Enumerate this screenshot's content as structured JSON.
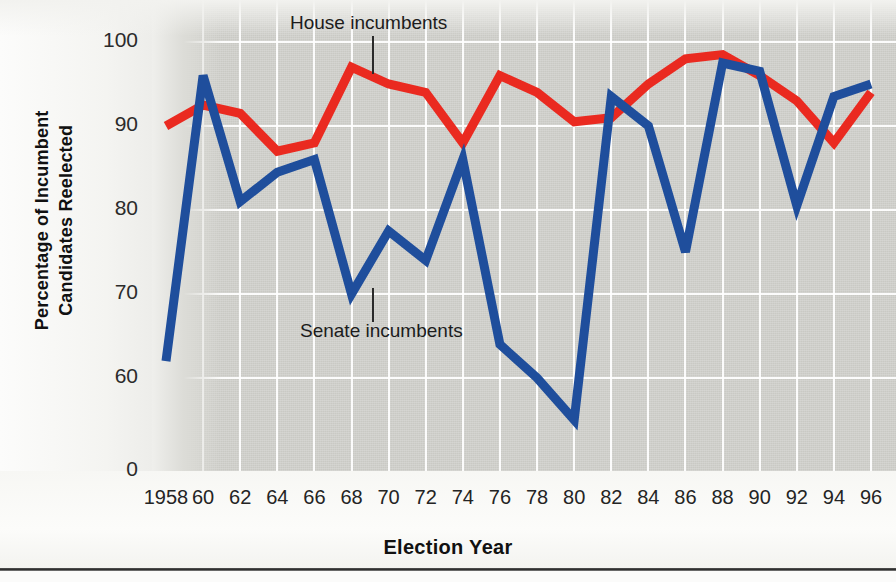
{
  "chart_data": {
    "type": "line",
    "title": "",
    "xlabel": "Election Year",
    "ylabel": "Percentage of Incumbent Candidates Reelected",
    "ylabel_line1": "Percentage of Incumbent",
    "ylabel_line2": "Candidates Reelected",
    "categories": [
      "1958",
      "60",
      "62",
      "64",
      "66",
      "68",
      "70",
      "72",
      "74",
      "76",
      "78",
      "80",
      "82",
      "84",
      "86",
      "88",
      "90",
      "92",
      "94",
      "96"
    ],
    "x": [
      1958,
      1960,
      1962,
      1964,
      1966,
      1968,
      1970,
      1972,
      1974,
      1976,
      1978,
      1980,
      1982,
      1984,
      1986,
      1988,
      1990,
      1992,
      1994,
      1996
    ],
    "yticks": [
      100,
      90,
      80,
      70,
      60,
      0
    ],
    "ytick_labels": [
      "100",
      "90",
      "80",
      "70",
      "60",
      "0"
    ],
    "ylim": [
      52,
      102
    ],
    "axis_break": true,
    "grid": true,
    "legend_position": "inline-annotations",
    "series": [
      {
        "name": "House incumbents",
        "color": "#ea2a20",
        "values": [
          90,
          92.5,
          91.5,
          87,
          88,
          97,
          95,
          94,
          88,
          96,
          94,
          90.5,
          91,
          95,
          98,
          98.5,
          96,
          93,
          88,
          94
        ]
      },
      {
        "name": "Senate incumbents",
        "color": "#1f4e9c",
        "values": [
          62,
          96,
          81,
          84.5,
          86,
          70,
          77.5,
          74,
          86,
          64,
          60,
          55,
          93.5,
          90,
          75,
          97.5,
          96.5,
          80.5,
          93.5,
          95
        ]
      }
    ],
    "annotations": [
      {
        "text": "House incumbents",
        "series": "House incumbents",
        "x_px": 290,
        "y_px": 12,
        "leader_x": 372,
        "leader_top": 36,
        "leader_height": 38
      },
      {
        "text": "Senate incumbents",
        "series": "Senate incumbents",
        "x_px": 300,
        "y_px": 320,
        "leader_x": 372,
        "leader_top": 288,
        "leader_height": 34
      }
    ]
  },
  "colors": {
    "house": "#ea2a20",
    "senate": "#1f4e9c",
    "panel": "#c9c9c4",
    "grid": "#ffffff",
    "text": "#1c1c1c"
  }
}
